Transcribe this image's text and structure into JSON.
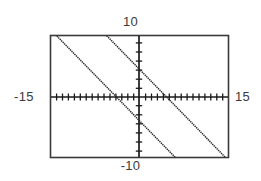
{
  "figure": {
    "title": "",
    "frame_color": "#3a3a3a",
    "line_color": "#2b2b2b",
    "axis_color": "#1a1a1a",
    "background": "#ffffff"
  },
  "labels": {
    "y_max": "10",
    "y_min": "-10",
    "x_min": "-15",
    "x_max": "15"
  },
  "chart_data": {
    "type": "line",
    "title": "",
    "xlabel": "",
    "ylabel": "",
    "xlim": [
      -15,
      15
    ],
    "ylim": [
      -10,
      10
    ],
    "grid": false,
    "legend": false,
    "x_tick_labels": [
      "-15",
      "15"
    ],
    "y_tick_labels": [
      "-10",
      "10"
    ],
    "x_tick_spacing": 1,
    "y_tick_spacing": 1,
    "line_style": "dotted",
    "series": [
      {
        "name": "line-1",
        "equation": "y = -x - 4",
        "slope": -1,
        "y_intercept": -4,
        "x_intercept": -4,
        "points": [
          [
            -15,
            11
          ],
          [
            15,
            -19
          ]
        ],
        "visible_points": [
          [
            -13.7,
            9.7
          ],
          [
            5.7,
            -9.7
          ]
        ]
      },
      {
        "name": "line-2",
        "equation": "y = -x + 4.5",
        "slope": -1,
        "y_intercept": 4.5,
        "x_intercept": 4.5,
        "points": [
          [
            -15,
            19.5
          ],
          [
            15,
            -10.5
          ]
        ],
        "visible_points": [
          [
            -5.2,
            9.7
          ],
          [
            14.2,
            -9.7
          ]
        ]
      }
    ]
  }
}
